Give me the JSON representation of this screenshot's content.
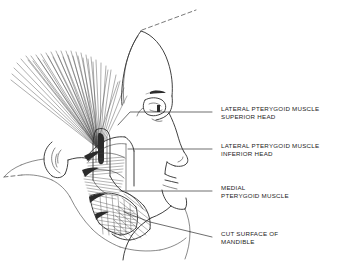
{
  "figure": {
    "background_color": "#ffffff",
    "ink_color": "#2b2b2b",
    "style": "pen-and-ink anatomical line drawing"
  },
  "labels": [
    {
      "id": "lateral-pterygoid-superior",
      "line1": "LATERAL PTERYGOID MUSCLE",
      "line2": "SUPERIOR HEAD",
      "x": 221,
      "y": 110
    },
    {
      "id": "lateral-pterygoid-inferior",
      "line1": "LATERAL PTERYGOID MUSCLE",
      "line2": "INFERIOR HEAD",
      "x": 221,
      "y": 147
    },
    {
      "id": "medial-pterygoid",
      "line1": "MEDIAL",
      "line2": "PTERYGOID MUSCLE",
      "x": 221,
      "y": 189
    },
    {
      "id": "cut-surface-mandible",
      "line1": "CUT SURFACE OF",
      "line2": "MANDIBLE",
      "x": 221,
      "y": 235
    }
  ],
  "anatomy_parts": [
    "temporalis-muscle-fan",
    "ear-auricle",
    "mandible-ramus",
    "mandible-cut-surface",
    "lateral-pterygoid-superior-head",
    "lateral-pterygoid-inferior-head",
    "medial-pterygoid-muscle",
    "facial-profile",
    "orbit-eye",
    "nose",
    "lips",
    "chin",
    "neck"
  ]
}
